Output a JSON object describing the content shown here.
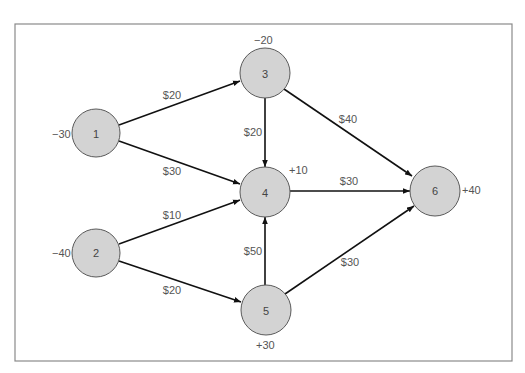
{
  "diagram": {
    "type": "network-flow",
    "nodes": [
      {
        "id": "1",
        "label": "1",
        "supply": "−30",
        "cx": 96,
        "cy": 133
      },
      {
        "id": "2",
        "label": "2",
        "supply": "−40",
        "cx": 96,
        "cy": 253
      },
      {
        "id": "3",
        "label": "3",
        "supply": "−20",
        "cx": 265,
        "cy": 73
      },
      {
        "id": "4",
        "label": "4",
        "supply": "+10",
        "cx": 265,
        "cy": 192
      },
      {
        "id": "5",
        "label": "5",
        "supply": "+30",
        "cx": 266,
        "cy": 310
      },
      {
        "id": "6",
        "label": "6",
        "supply": "+40",
        "cx": 435,
        "cy": 191
      }
    ],
    "edges": [
      {
        "from": "1",
        "to": "3",
        "cost": "$20"
      },
      {
        "from": "1",
        "to": "4",
        "cost": "$30"
      },
      {
        "from": "2",
        "to": "4",
        "cost": "$10"
      },
      {
        "from": "2",
        "to": "5",
        "cost": "$20"
      },
      {
        "from": "3",
        "to": "4",
        "cost": "$20"
      },
      {
        "from": "3",
        "to": "6",
        "cost": "$40"
      },
      {
        "from": "4",
        "to": "6",
        "cost": "$30"
      },
      {
        "from": "5",
        "to": "4",
        "cost": "$50"
      },
      {
        "from": "5",
        "to": "6",
        "cost": "$30"
      }
    ],
    "colors": {
      "node_fill": "#d3d3d3",
      "node_stroke": "#5a5a5a",
      "edge": "#111111",
      "frame": "#8a8a8a",
      "text": "#555555"
    }
  }
}
